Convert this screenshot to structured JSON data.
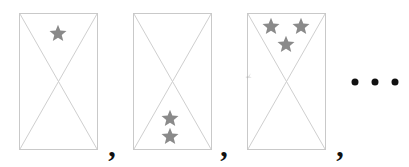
{
  "figure": {
    "type": "sequence-of-star-panels",
    "canvas": {
      "width": 409,
      "height": 167,
      "background": "#ffffff"
    },
    "style": {
      "panel_border_color": "#c9c9c9",
      "diagonal_color": "#cfcfcf",
      "star_color": "#8a8a8a",
      "separator_color": "#111111",
      "ellipsis_color": "#111111"
    },
    "panels": [
      {
        "index": 1,
        "name": "panel-1",
        "star_count": 1,
        "rect": {
          "x": 19,
          "y": 13,
          "width": 79,
          "height": 137
        },
        "diagonals": [
          "top-left-to-bottom-right",
          "top-right-to-bottom-left"
        ],
        "stars": [
          {
            "label": "star-1",
            "cx": 58,
            "cy": 33,
            "size": 18
          }
        ]
      },
      {
        "index": 2,
        "name": "panel-2",
        "star_count": 2,
        "rect": {
          "x": 133,
          "y": 13,
          "width": 79,
          "height": 137
        },
        "diagonals": [
          "top-left-to-bottom-right",
          "top-right-to-bottom-left"
        ],
        "stars": [
          {
            "label": "star-1",
            "cx": 170,
            "cy": 118,
            "size": 18
          },
          {
            "label": "star-2",
            "cx": 170,
            "cy": 136,
            "size": 18
          }
        ]
      },
      {
        "index": 3,
        "name": "panel-3",
        "star_count": 3,
        "rect": {
          "x": 247,
          "y": 13,
          "width": 79,
          "height": 137
        },
        "diagonals": [
          "top-left-to-bottom-right",
          "top-right-to-bottom-left"
        ],
        "stars": [
          {
            "label": "star-1",
            "cx": 271,
            "cy": 26,
            "size": 18
          },
          {
            "label": "star-2",
            "cx": 301,
            "cy": 26,
            "size": 18
          },
          {
            "label": "star-3",
            "cx": 286,
            "cy": 44,
            "size": 18
          }
        ],
        "artifact": {
          "label": "edge-smudge",
          "cx": 249,
          "cy": 76
        }
      }
    ],
    "separators": [
      {
        "label": "comma-1",
        "text": ",",
        "x": 112,
        "y": 146
      },
      {
        "label": "comma-2",
        "text": ",",
        "x": 224,
        "y": 146
      },
      {
        "label": "comma-3",
        "text": ",",
        "x": 340,
        "y": 146
      }
    ],
    "ellipsis": {
      "label": "ellipsis",
      "text": "...",
      "dot_count": 3,
      "x": 375,
      "y": 82
    }
  }
}
